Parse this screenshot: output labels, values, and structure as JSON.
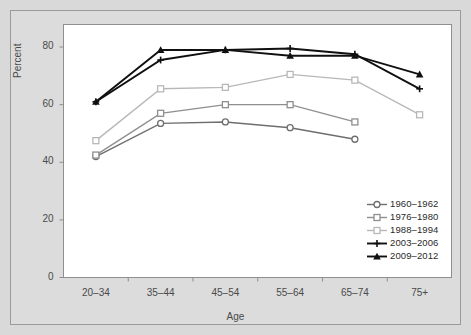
{
  "chart_data": {
    "type": "line",
    "title": "",
    "xlabel": "Age",
    "ylabel": "Percent",
    "categories": [
      "20–34",
      "35–44",
      "45–54",
      "55–64",
      "65–74",
      "75+"
    ],
    "ylim": [
      0,
      88
    ],
    "yticks": [
      0,
      20,
      40,
      60,
      80
    ],
    "ytick_labels": [
      "0",
      "20",
      "40",
      "60",
      "80"
    ],
    "grid": false,
    "legend_position": "inside-lower-right",
    "series": [
      {
        "name": "1960–1962",
        "color": "#6e6e6e",
        "marker": "circle",
        "values": [
          42.0,
          53.5,
          54.0,
          52.0,
          48.0,
          null
        ]
      },
      {
        "name": "1976–1980",
        "color": "#8f8f8f",
        "marker": "square",
        "values": [
          42.5,
          57.0,
          60.0,
          60.0,
          54.0,
          null
        ]
      },
      {
        "name": "1988–1994",
        "color": "#b8b8b8",
        "marker": "square",
        "values": [
          47.5,
          65.5,
          66.0,
          70.5,
          68.5,
          56.5
        ]
      },
      {
        "name": "2003–2006",
        "color": "#101010",
        "marker": "plus",
        "values": [
          61.0,
          75.5,
          79.0,
          79.5,
          77.5,
          65.5
        ]
      },
      {
        "name": "2009–2012",
        "color": "#101010",
        "marker": "triangle",
        "values": [
          61.0,
          79.0,
          79.0,
          77.0,
          77.0,
          70.5
        ]
      }
    ]
  },
  "axes": {
    "y_title": "Percent",
    "x_title": "Age"
  },
  "colors": {
    "page_background": "#d9d9d9",
    "plot_background": "#ffffff",
    "axis": "#8f8f8f",
    "text": "#4a4a4a"
  }
}
